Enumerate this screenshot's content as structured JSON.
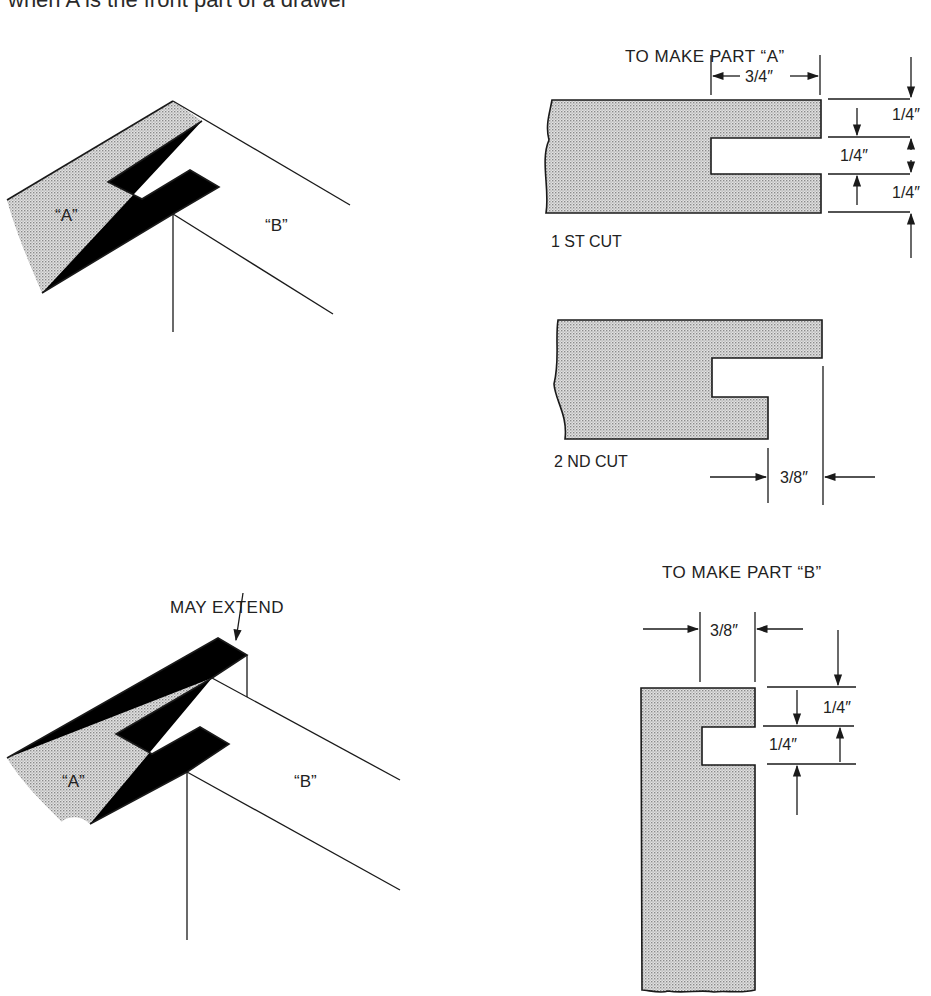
{
  "caption": "when A is the front part of a drawer",
  "views": {
    "iso_top": {
      "part_a_label": "“A”",
      "part_b_label": "“B”"
    },
    "iso_bottom": {
      "part_a_label": "“A”",
      "part_b_label": "“B”",
      "callout": "MAY EXTEND"
    },
    "part_a": {
      "title": "TO MAKE PART “A”",
      "first_cut": {
        "label": "1 ST CUT",
        "depth": "3/4″",
        "top": "1/4″",
        "middle": "1/4″",
        "bottom": "1/4″"
      },
      "second_cut": {
        "label": "2 ND CUT",
        "width": "3/8″"
      }
    },
    "part_b": {
      "title": "TO MAKE PART “B”",
      "width": "3/8″",
      "top": "1/4″",
      "slot": "1/4″"
    }
  },
  "colors": {
    "ink": "#1a1a1a",
    "stipple": "#c4c4c4",
    "background": "#ffffff"
  }
}
